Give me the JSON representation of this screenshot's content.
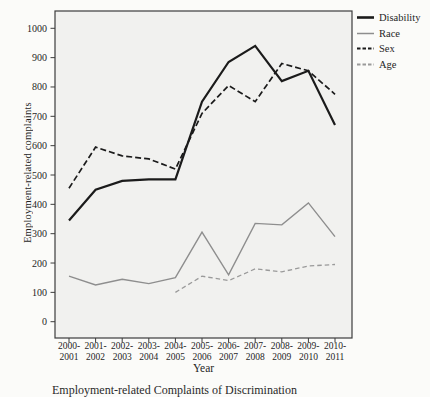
{
  "page": {
    "background": "#fbfbf9"
  },
  "chart_data": {
    "type": "line",
    "title": "",
    "xlabel": "Year",
    "ylabel": "Employment-related complaints",
    "caption": "Employment-related Complaints of Discrimination",
    "categories": [
      "2000-2001",
      "2001-2002",
      "2002-2003",
      "2003-2004",
      "2004-2005",
      "2005-2006",
      "2006-2007",
      "2007-2008",
      "2008-2009",
      "2009-2010",
      "2010-2011"
    ],
    "ylim": [
      0,
      1000
    ],
    "ytick_step": 100,
    "yticks": [
      0,
      100,
      200,
      300,
      400,
      500,
      600,
      700,
      800,
      900,
      1000
    ],
    "grid": false,
    "legend_position": "top-right",
    "plot_bg": "#f1f1ef",
    "axis_color": "#3c3c3c",
    "text_color": "#1f1f1f",
    "series": [
      {
        "name": "Disability",
        "color": "#1b1b1b",
        "dash": null,
        "width": 2.2,
        "values": [
          345,
          450,
          480,
          485,
          485,
          750,
          885,
          940,
          820,
          855,
          670
        ]
      },
      {
        "name": "Race",
        "color": "#8e8e8e",
        "dash": null,
        "width": 1.4,
        "values": [
          155,
          125,
          145,
          130,
          150,
          305,
          160,
          335,
          330,
          405,
          290
        ]
      },
      {
        "name": "Sex",
        "color": "#1b1b1b",
        "dash": "6,3",
        "width": 1.7,
        "values": [
          455,
          595,
          565,
          555,
          520,
          710,
          805,
          750,
          880,
          855,
          775
        ]
      },
      {
        "name": "Age",
        "color": "#9a9a9a",
        "dash": "4.5,3",
        "width": 1.3,
        "values": [
          null,
          null,
          null,
          null,
          100,
          155,
          140,
          180,
          170,
          190,
          195
        ]
      }
    ]
  }
}
